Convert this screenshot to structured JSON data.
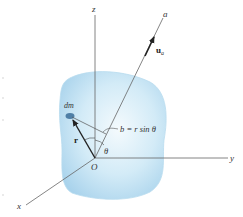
{
  "figure": {
    "axes": {
      "x_label": "x",
      "y_label": "y",
      "z_label": "z",
      "a_label": "a",
      "origin_label": "O"
    },
    "vectors": {
      "unit_vector_label": "u",
      "unit_vector_subscript": "a",
      "position_vector_label": "r"
    },
    "mass_element_label": "dm",
    "distance_equation": "b = r sin θ",
    "angle_label": "θ",
    "colors": {
      "body_fill": "#bfe0f2",
      "body_edge": "#a8d2ea",
      "mass_element": "#4f7fa6",
      "axis_line": "#666666",
      "vector": "#222222"
    }
  }
}
